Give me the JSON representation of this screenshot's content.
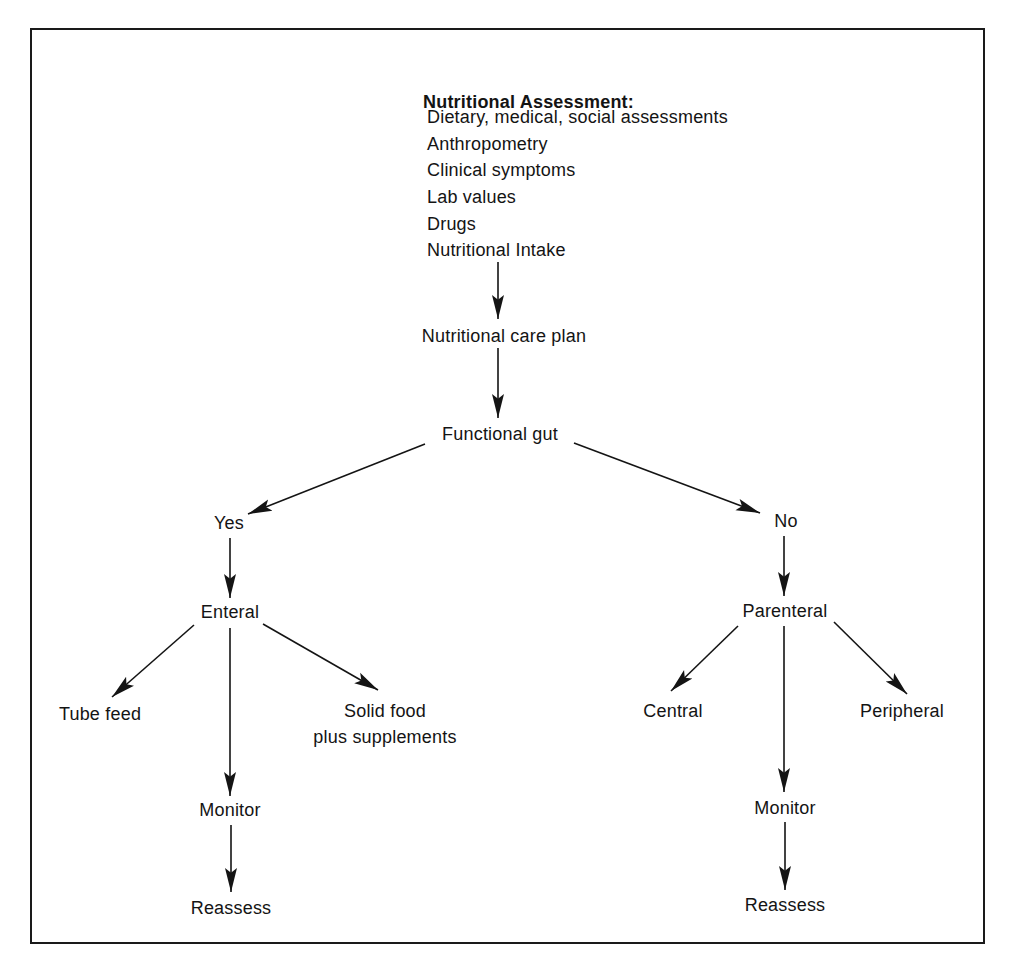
{
  "diagram": {
    "title": "Nutritional Assessment:",
    "assessment_items": [
      "Dietary, medical, social assessments",
      "Anthropometry",
      "Clinical symptoms",
      "Lab values",
      "Drugs",
      "Nutritional Intake"
    ],
    "nodes": {
      "care_plan": "Nutritional care plan",
      "functional_gut": "Functional gut",
      "yes": "Yes",
      "no": "No",
      "enteral": "Enteral",
      "parenteral": "Parenteral",
      "tube_feed": "Tube feed",
      "solid_food_line1": "Solid food",
      "solid_food_line2": "plus supplements",
      "central": "Central",
      "peripheral": "Peripheral",
      "monitor_left": "Monitor",
      "reassess_left": "Reassess",
      "monitor_right": "Monitor",
      "reassess_right": "Reassess"
    },
    "edges": [
      [
        "Nutritional Assessment",
        "Nutritional care plan"
      ],
      [
        "Nutritional care plan",
        "Functional gut"
      ],
      [
        "Functional gut",
        "Yes"
      ],
      [
        "Functional gut",
        "No"
      ],
      [
        "Yes",
        "Enteral"
      ],
      [
        "No",
        "Parenteral"
      ],
      [
        "Enteral",
        "Tube feed"
      ],
      [
        "Enteral",
        "Solid food plus supplements"
      ],
      [
        "Enteral",
        "Monitor"
      ],
      [
        "Monitor",
        "Reassess"
      ],
      [
        "Parenteral",
        "Central"
      ],
      [
        "Parenteral",
        "Peripheral"
      ],
      [
        "Parenteral",
        "Monitor"
      ],
      [
        "Monitor",
        "Reassess"
      ]
    ],
    "colors": {
      "ink": "#141414",
      "background": "#ffffff"
    }
  }
}
